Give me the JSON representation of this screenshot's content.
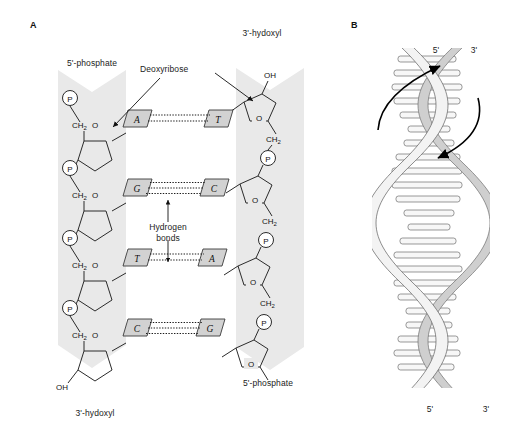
{
  "figure": {
    "panels": [
      {
        "letter": "A",
        "name": "chemical-structure-of-dna"
      },
      {
        "letter": "B",
        "name": "dna-double-helix"
      }
    ]
  },
  "panel_a": {
    "labels": {
      "top_left": "5'-phosphate",
      "top_right": "3'-hydoxyl",
      "bottom_left": "3'-hydoxyl",
      "bottom_right": "5'-phosphate",
      "deoxyribose": "Deoxyribose",
      "hydrogen_bonds_line1": "Hydrogen",
      "hydrogen_bonds_line2": "bonds"
    },
    "atoms": {
      "phosphate": "P",
      "ch2": "CH",
      "ch2_sub": "2",
      "ring_oxygen": "O",
      "hydroxyl": "OH"
    },
    "base_pairs": [
      {
        "left": "A",
        "right": "T",
        "bonds": 2
      },
      {
        "left": "G",
        "right": "C",
        "bonds": 3
      },
      {
        "left": "T",
        "right": "A",
        "bonds": 2
      },
      {
        "left": "C",
        "right": "G",
        "bonds": 3
      }
    ]
  },
  "panel_b": {
    "top_left_end": "5'",
    "top_right_end": "3'",
    "bottom_left_end": "5'",
    "bottom_right_end": "3'"
  },
  "colors": {
    "ribbon": "#e9e9e9",
    "base_box": "#d2d2d2",
    "line": "#2b2b2b",
    "helix_back": "#cfcfcf",
    "helix_front": "#f3f3f3"
  }
}
